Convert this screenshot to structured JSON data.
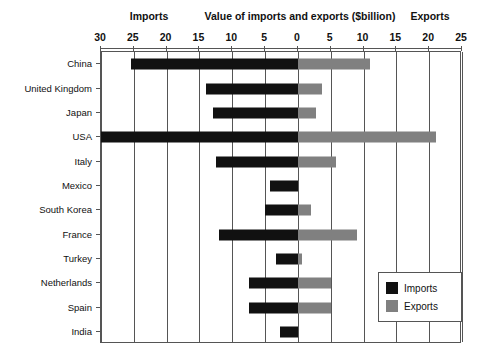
{
  "header": {
    "imports_label": "Imports",
    "title": "Value of imports and exports ($billion)",
    "exports_label": "Exports"
  },
  "legend": {
    "position": "bottom-right",
    "entries": [
      {
        "label": "Imports",
        "color": "#111111"
      },
      {
        "label": "Exports",
        "color": "#808080"
      }
    ]
  },
  "colors": {
    "imports": "#111111",
    "exports": "#808080",
    "axis": "#555555",
    "background": "#ffffff",
    "text": "#111111"
  },
  "chart_data": {
    "type": "bar",
    "orientation": "horizontal",
    "subtype": "diverging-bidirectional",
    "title": "Value of imports and exports ($billion)",
    "xlabel": "Value of imports and exports ($billion)",
    "ylabel": "",
    "left_axis_title": "Imports",
    "right_axis_title": "Exports",
    "grid": true,
    "grid_axis": "x",
    "legend_position": "bottom-right",
    "xlim": [
      -30,
      25
    ],
    "axis_tick_values": [
      -30,
      -25,
      -20,
      -15,
      -10,
      -5,
      0,
      5,
      10,
      15,
      20,
      25
    ],
    "tick_labels": [
      "30",
      "25",
      "20",
      "15",
      "10",
      "5",
      "0",
      "5",
      "10",
      "15",
      "20",
      "25"
    ],
    "categories": [
      "China",
      "United Kingdom",
      "Japan",
      "USA",
      "Italy",
      "Mexico",
      "South Korea",
      "France",
      "Turkey",
      "Netherlands",
      "Spain",
      "India"
    ],
    "series": [
      {
        "name": "Imports",
        "color": "#111111",
        "values": [
          25.5,
          14.0,
          13.0,
          30.0,
          12.5,
          4.3,
          5.0,
          12.0,
          3.3,
          7.5,
          7.5,
          2.7
        ]
      },
      {
        "name": "Exports",
        "color": "#808080",
        "values": [
          11.0,
          3.6,
          2.8,
          21.0,
          5.8,
          0.0,
          2.0,
          9.0,
          0.6,
          5.0,
          5.0,
          0.0
        ]
      }
    ]
  }
}
